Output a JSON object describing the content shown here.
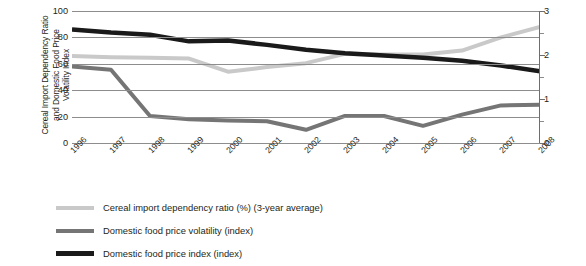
{
  "chart_data": {
    "type": "line",
    "title": "",
    "xlabel": "",
    "ylabel": "Cereal Import Dependency Ratio\nand Domestic Food Price\nVolatility Index",
    "ylabel_right": "",
    "categories": [
      "1996",
      "1997",
      "1998",
      "1999",
      "2000",
      "2001",
      "2002",
      "2003",
      "2004",
      "2005",
      "2006",
      "2007",
      "2008"
    ],
    "ylim": [
      0,
      100
    ],
    "yticks": [
      0,
      20,
      40,
      60,
      80,
      100
    ],
    "ylim_right": [
      0,
      3
    ],
    "yticks_right": [
      0,
      1,
      2,
      3
    ],
    "yticks_right_minor": [
      0.5,
      1.5,
      2.5
    ],
    "grid": true,
    "legend_position": "bottom-left",
    "series": [
      {
        "name": "Cereal import dependency ratio (%) (3-year average)",
        "axis": "left",
        "color": "#c9c9c9",
        "width": 4,
        "values": [
          66,
          65,
          64.5,
          64,
          54,
          57.5,
          60.5,
          67.5,
          67,
          67,
          70,
          80,
          88
        ]
      },
      {
        "name": "Domestic food price volatility (index)",
        "axis": "left",
        "color": "#757575",
        "width": 4,
        "values": [
          58,
          55.5,
          20.5,
          18,
          17,
          16.5,
          10,
          20.5,
          20.5,
          13,
          21.5,
          28.5,
          29
        ]
      },
      {
        "name": "Domestic food price index (index)",
        "axis": "right",
        "color": "#1a1a1a",
        "width": 4.5,
        "values": [
          2.58,
          2.51,
          2.46,
          2.31,
          2.33,
          2.23,
          2.12,
          2.04,
          1.99,
          1.94,
          1.87,
          1.76,
          1.63
        ]
      }
    ],
    "legend": [
      {
        "label": "Cereal import dependency ratio (%) (3-year average)",
        "color": "#c9c9c9"
      },
      {
        "label": "Domestic food price volatility (index)",
        "color": "#757575"
      },
      {
        "label": "Domestic food price index (index)",
        "color": "#1a1a1a"
      }
    ]
  }
}
